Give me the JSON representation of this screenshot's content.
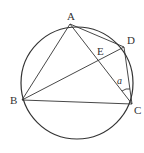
{
  "diagram": {
    "type": "inscribed-quadrilateral",
    "circle": {
      "cx": 77,
      "cy": 83,
      "r": 56
    },
    "points": {
      "A": {
        "label": "A",
        "x": 70,
        "y": 24
      },
      "B": {
        "label": "B",
        "x": 22,
        "y": 100
      },
      "C": {
        "label": "C",
        "x": 132,
        "y": 104
      },
      "D": {
        "label": "D",
        "x": 124,
        "y": 47
      },
      "E": {
        "label": "E"
      }
    },
    "segments": [
      "AB",
      "AC",
      "AD",
      "BD",
      "BC",
      "DC"
    ],
    "angle_label": "a",
    "angle_mark": "angle ACD (marked a)",
    "stroke_color": "#333333"
  }
}
